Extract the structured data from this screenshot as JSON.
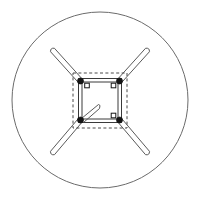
{
  "image": {
    "title": "Four-leg frame plan view in circular boundary",
    "width": 201,
    "height": 208,
    "background_color": "#ffffff",
    "kind": "technical-line-drawing"
  },
  "palette": {
    "circle_stroke": "#6b6b6b",
    "frame_stroke": "#3a3a3a",
    "leg_stroke": "#5a5a5a",
    "dashed_stroke": "#4a4a4a",
    "node_filled": "#151515",
    "node_open_fill": "#ffffff"
  },
  "boundary_circle": {
    "label": "outer-circle",
    "cx": 100,
    "cy": 100,
    "r": 88
  },
  "dashed_rect": {
    "label": "dashed-boundary-rectangle",
    "x": 73,
    "y": 73,
    "width": 54,
    "height": 55,
    "dash": "3 2.4"
  },
  "inner_frame_outer": {
    "label": "frame-outer-square",
    "x": 78.5,
    "y": 78.5,
    "width": 43,
    "height": 44
  },
  "inner_frame_inner": {
    "label": "frame-inner-square",
    "x": 82,
    "y": 82,
    "width": 36,
    "height": 37
  },
  "nodes": [
    {
      "label": "node-top-left",
      "cx": 80.5,
      "cy": 81,
      "r": 3.1,
      "style": "filled"
    },
    {
      "label": "node-top-right",
      "cx": 119.5,
      "cy": 81,
      "r": 3.1,
      "style": "filled"
    },
    {
      "label": "node-bottom-left",
      "cx": 80.5,
      "cy": 120,
      "r": 3.1,
      "style": "filled"
    },
    {
      "label": "node-bottom-right",
      "cx": 119.5,
      "cy": 120,
      "r": 3.1,
      "style": "filled"
    },
    {
      "label": "node-open-top-left",
      "cx": 87,
      "cy": 85.5,
      "r": 2.3,
      "style": "open"
    },
    {
      "label": "node-open-top-right",
      "cx": 113.5,
      "cy": 85.5,
      "r": 2.3,
      "style": "open"
    },
    {
      "label": "node-open-bottom-right",
      "cx": 113.5,
      "cy": 115.5,
      "r": 2.3,
      "style": "open"
    }
  ],
  "legs": [
    {
      "label": "leg-top-left",
      "x1": 80.5,
      "y1": 81,
      "x2": 52.5,
      "y2": 50,
      "half_width": 2.6,
      "cap": "round"
    },
    {
      "label": "leg-top-right",
      "x1": 119.5,
      "y1": 81,
      "x2": 147.5,
      "y2": 50,
      "half_width": 2.6,
      "cap": "round"
    },
    {
      "label": "leg-bottom-left",
      "x1": 80.5,
      "y1": 120,
      "x2": 52.5,
      "y2": 153,
      "half_width": 2.6,
      "cap": "round"
    },
    {
      "label": "leg-bottom-right",
      "x1": 119.5,
      "y1": 120,
      "x2": 147.5,
      "y2": 153,
      "half_width": 2.6,
      "cap": "round"
    }
  ],
  "stub_lines": [
    {
      "label": "stub-upper",
      "x1": 81.5,
      "y1": 118.5,
      "x2": 98.5,
      "y2": 104.5
    },
    {
      "label": "stub-lower",
      "x1": 83.5,
      "y1": 122.5,
      "x2": 99.5,
      "y2": 108.5
    }
  ],
  "callouts": []
}
